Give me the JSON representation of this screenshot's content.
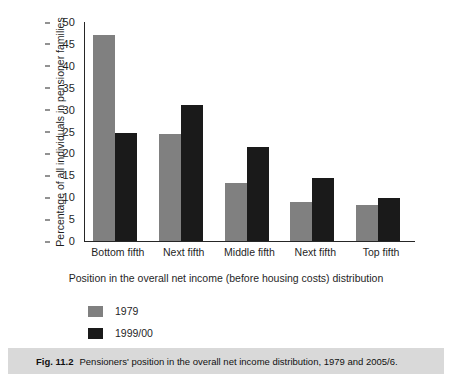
{
  "chart_data": {
    "type": "bar",
    "title": "",
    "categories": [
      "Bottom fifth",
      "Next fifth",
      "Middle fifth",
      "Next fifth",
      "Top fifth"
    ],
    "series": [
      {
        "name": "1979",
        "color": "#808080",
        "values": [
          47.0,
          24.4,
          13.2,
          9.0,
          8.2
        ]
      },
      {
        "name": "1999/00",
        "color": "#1a1a1a",
        "values": [
          24.7,
          31.0,
          21.5,
          14.4,
          9.9
        ]
      }
    ],
    "xlabel": "Position in the overall net income (before housing costs) distribution",
    "ylabel": "Percentage of all individuals in pensioner families",
    "ylim": [
      0,
      50
    ],
    "ytick_values": [
      0,
      5,
      10,
      15,
      20,
      25,
      30,
      35,
      40,
      45,
      50
    ],
    "ytick_labels": [
      "0",
      "5",
      "10",
      "15",
      "20",
      "25",
      "30",
      "35",
      "40",
      "45",
      "50"
    ],
    "grid": false,
    "legend_position": "below-left"
  },
  "caption": {
    "figure_number": "Fig. 11.2",
    "text": "Pensioners' position in the overall net income distribution, 1979 and 2005/6."
  }
}
